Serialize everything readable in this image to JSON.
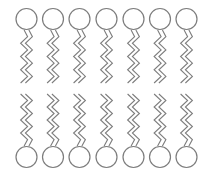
{
  "diagram": {
    "stroke_color": "#7d7d7d",
    "background": "#ffffff",
    "lipid_count_per_leaflet": 7,
    "head_radius": 10.5,
    "head_centers_x": [
      26.5,
      53,
      79.5,
      106.5,
      133.5,
      160,
      186.5
    ],
    "leaflets": [
      {
        "name": "outer-leaflet",
        "orientation": "heads-up",
        "head_center_y": 19,
        "tail_start_y": 30,
        "tail_end_y": 83
      },
      {
        "name": "inner-leaflet",
        "orientation": "heads-down",
        "head_center_y": 157,
        "tail_start_y": 146,
        "tail_end_y": 94
      }
    ],
    "tail": {
      "segments": 8,
      "amplitude": 3.5,
      "pair_offset": 4
    }
  }
}
